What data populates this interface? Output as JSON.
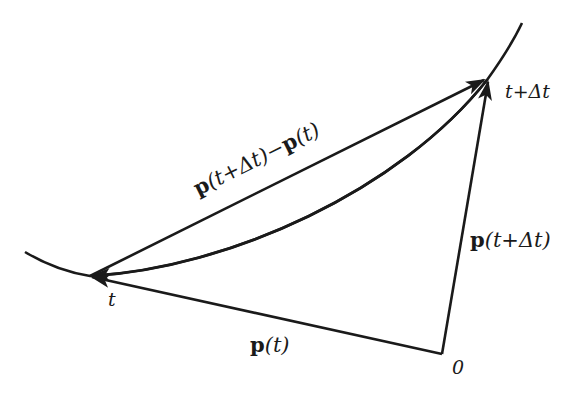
{
  "diagram": {
    "type": "vector-difference-on-curve",
    "colors": {
      "stroke": "#1a1a1a",
      "background": "#ffffff"
    },
    "points": {
      "t": {
        "label": "t",
        "x": 90,
        "y": 276
      },
      "t_plus_dt": {
        "label": "t+Δt",
        "x": 487,
        "y": 80
      },
      "origin": {
        "label": "0",
        "x": 442,
        "y": 354
      }
    },
    "vectors": [
      {
        "id": "p_t",
        "bold": "p",
        "arg": "(t)",
        "from": "origin",
        "to": "t"
      },
      {
        "id": "p_t_dt",
        "bold": "p",
        "arg": "(t+Δt)",
        "from": "origin",
        "to": "t_plus_dt"
      },
      {
        "id": "difference",
        "bold1": "p",
        "arg1": "(t+Δt)",
        "minus": "−",
        "bold2": "p",
        "arg2": "(t)",
        "from": "t",
        "to": "t_plus_dt"
      }
    ],
    "labels": {
      "t": "t",
      "t_plus_dt": "t+Δt",
      "origin": "0",
      "p_t": {
        "b": "p",
        "rest": "(t)"
      },
      "p_t_dt": {
        "b": "p",
        "rest": "(t+Δt)"
      },
      "diff": {
        "b1": "p",
        "r1": "(t+Δt)",
        "minus": "−",
        "b2": "p",
        "r2": "(t)"
      }
    }
  }
}
